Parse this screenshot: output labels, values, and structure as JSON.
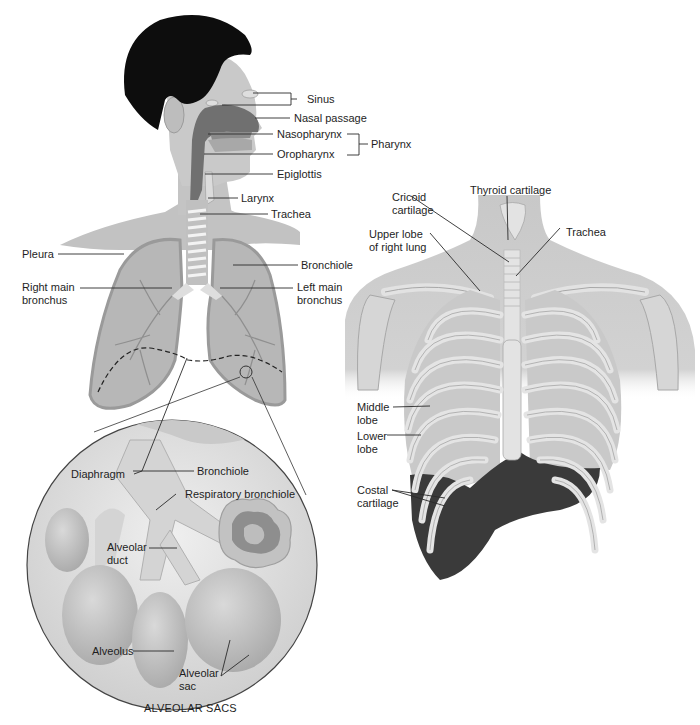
{
  "diagram": {
    "type": "anatomy",
    "panels": [
      "head-and-lungs",
      "alveolar-sacs-inset",
      "thorax-ribcage"
    ]
  },
  "colors": {
    "background": "#ffffff",
    "skin": "#c4c4c4",
    "skin_light": "#d6d6d6",
    "hair": "#0d0d0d",
    "airway_dark": "#6e6e6e",
    "lung": "#b9b9b9",
    "bone": "#dedede",
    "diaphragm_dark": "#3a3a3a",
    "leader_line": "#2a2a2a"
  },
  "labels": {
    "head": {
      "sinus": "Sinus",
      "nasal_passage": "Nasal passage",
      "nasopharynx": "Nasopharynx",
      "oropharynx": "Oropharynx",
      "pharynx": "Pharynx",
      "epiglottis": "Epiglottis",
      "larynx": "Larynx",
      "trachea": "Trachea"
    },
    "lungs": {
      "pleura": "Pleura",
      "bronchiole": "Bronchiole",
      "right_main_bronchus_1": "Right main",
      "right_main_bronchus_2": "bronchus",
      "left_main_bronchus_1": "Left main",
      "left_main_bronchus_2": "bronchus",
      "diaphragm": "Diaphragm"
    },
    "inset": {
      "bronchiole": "Bronchiole",
      "respiratory_bronchiole": "Respiratory bronchiole",
      "alveolar_duct_1": "Alveolar",
      "alveolar_duct_2": "duct",
      "alveolus": "Alveolus",
      "alveolar_sac_1": "Alveolar",
      "alveolar_sac_2": "sac",
      "caption": "ALVEOLAR SACS"
    },
    "thorax": {
      "thyroid_cartilage": "Thyroid cartilage",
      "cricoid_cartilage_1": "Cricoid",
      "cricoid_cartilage_2": "cartilage",
      "upper_lobe_1": "Upper lobe",
      "upper_lobe_2": "of right lung",
      "trachea": "Trachea",
      "middle_lobe_1": "Middle",
      "middle_lobe_2": "lobe",
      "lower_lobe_1": "Lower",
      "lower_lobe_2": "lobe",
      "costal_cartilage_1": "Costal",
      "costal_cartilage_2": "cartilage"
    }
  }
}
